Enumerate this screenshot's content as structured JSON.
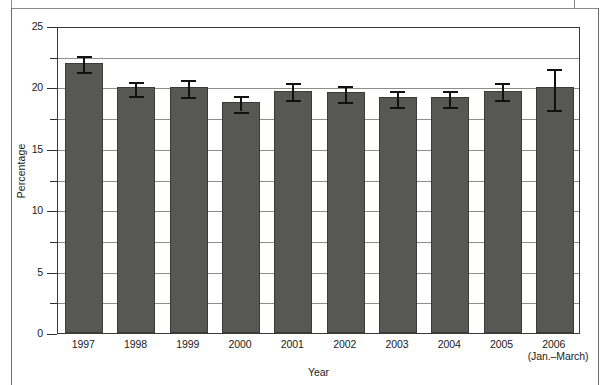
{
  "chart_data": {
    "type": "bar",
    "title": "",
    "xlabel": "Year",
    "ylabel": "Percentage",
    "ylim": [
      0,
      25
    ],
    "ytick_labels": [
      "0",
      "5",
      "10",
      "15",
      "20",
      "25"
    ],
    "ytick_values": [
      0,
      5,
      10,
      15,
      20,
      25
    ],
    "yminor_values": [
      2.5,
      7.5,
      12.5,
      17.5,
      22.5
    ],
    "grid": "horizontal gridlines at every 2.5 units",
    "legend": "none",
    "bar_color": "#575754",
    "error_bar_color": "#111111",
    "categories": [
      "1997",
      "1998",
      "1999",
      "2000",
      "2001",
      "2002",
      "2003",
      "2004",
      "2005",
      "2006"
    ],
    "category_sublabels": [
      "",
      "",
      "",
      "",
      "",
      "",
      "",
      "",
      "",
      "(Jan.–March)"
    ],
    "values": [
      22.0,
      20.0,
      20.0,
      18.8,
      19.7,
      19.6,
      19.2,
      19.2,
      19.7,
      20.0
    ],
    "error_low": [
      21.4,
      19.5,
      19.4,
      18.2,
      19.1,
      19.0,
      18.6,
      18.6,
      19.1,
      18.3
    ],
    "error_high": [
      22.7,
      20.6,
      20.8,
      19.5,
      20.5,
      20.3,
      19.9,
      19.9,
      20.5,
      21.7
    ]
  },
  "frame": {
    "left_border_color": "#6d6d6d",
    "right_border_color": "#6d6d6d"
  }
}
